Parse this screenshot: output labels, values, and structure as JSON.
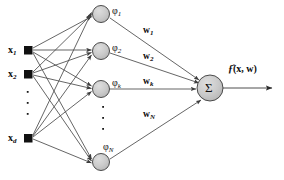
{
  "diagram": {
    "type": "neural-network-diagram",
    "colors": {
      "node_fill": "#c9c9c9",
      "node_stroke": "#3a3a3a",
      "input_fill": "#111111",
      "edge": "#4a4a4a",
      "text": "#0d0d0d",
      "background": "#ffffff"
    },
    "inputs": [
      {
        "id": "x1",
        "label": "x",
        "sub": "1",
        "x": 28,
        "y": 50
      },
      {
        "id": "x2",
        "label": "x",
        "sub": "2",
        "x": 28,
        "y": 74
      },
      {
        "id": "xd",
        "label": "x",
        "sub": "d",
        "x": 28,
        "y": 138
      }
    ],
    "input_ellipsis": {
      "dots": 3,
      "x": 28,
      "ys": [
        92,
        103,
        114
      ]
    },
    "hidden": [
      {
        "id": "phi1",
        "label": "φ",
        "sub": "1",
        "x": 101,
        "y": 14
      },
      {
        "id": "phi2",
        "label": "φ",
        "sub": "2",
        "x": 101,
        "y": 51
      },
      {
        "id": "phik",
        "label": "φ",
        "sub": "k",
        "x": 101,
        "y": 89
      },
      {
        "id": "phiN",
        "label": "φ",
        "sub": "N",
        "x": 101,
        "y": 162
      }
    ],
    "hidden_ellipsis": {
      "dots": 3,
      "x": 103,
      "ys": [
        107,
        118,
        129
      ]
    },
    "weights": [
      {
        "id": "w1",
        "label": "w",
        "sub": "1",
        "x": 147,
        "y": 32
      },
      {
        "id": "w2",
        "label": "w",
        "sub": "2",
        "x": 147,
        "y": 58
      },
      {
        "id": "wk",
        "label": "w",
        "sub": "k",
        "x": 147,
        "y": 83
      },
      {
        "id": "wN",
        "label": "w",
        "sub": "N",
        "x": 147,
        "y": 116
      }
    ],
    "summation": {
      "id": "sigma",
      "symbol": "Σ",
      "x": 210,
      "y": 88,
      "r": 13
    },
    "output": {
      "label_prefix": "ƒ̂",
      "label_args": "(x, w)",
      "full": "ƒ̂(x, w)",
      "x": 244,
      "y": 70
    }
  }
}
